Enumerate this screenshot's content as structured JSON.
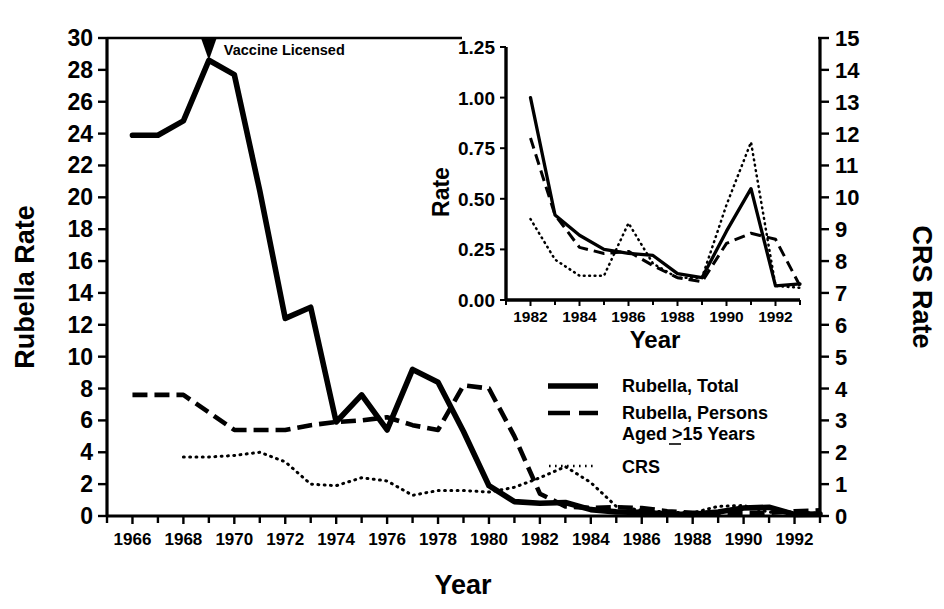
{
  "figure": {
    "annotation": "Vaccine Licensed",
    "xlabel": "Year",
    "left_axis_title": "Rubella Rate",
    "right_axis_title": "CRS Rate"
  },
  "legend": {
    "items": [
      {
        "label": "Rubella, Total",
        "style": "solid"
      },
      {
        "label": "Rubella, Persons",
        "label2": "Aged >15 Years",
        "style": "dashed"
      },
      {
        "label": "CRS",
        "style": "dotted"
      }
    ]
  },
  "inset": {
    "ylabel": "Rate",
    "xlabel": "Year"
  },
  "chart_data": [
    {
      "type": "line",
      "id": "main-chart",
      "title": "",
      "xlabel": "Year",
      "ylabel": "Rubella Rate",
      "y2label": "CRS Rate",
      "xlim": [
        1965,
        1993
      ],
      "ylim": [
        0,
        30
      ],
      "y2lim": [
        0,
        15
      ],
      "grid": false,
      "xticks": [
        1966,
        1968,
        1970,
        1972,
        1974,
        1976,
        1978,
        1980,
        1982,
        1984,
        1986,
        1988,
        1990,
        1992
      ],
      "xtick_labels": [
        "1966",
        "1968",
        "1970",
        "1972",
        "1974",
        "1976",
        "1978",
        "1980",
        "1982",
        "1984",
        "1986",
        "1988",
        "1990",
        "1992"
      ],
      "xtick_minor": [
        1965,
        1967,
        1969,
        1971,
        1973,
        1975,
        1977,
        1979,
        1981,
        1983,
        1985,
        1987,
        1989,
        1991,
        1993
      ],
      "yticks": [
        0,
        2,
        4,
        6,
        8,
        10,
        12,
        14,
        16,
        18,
        20,
        22,
        24,
        26,
        28,
        30
      ],
      "ytick_labels": [
        "0",
        "2",
        "4",
        "6",
        "8",
        "10",
        "12",
        "14",
        "16",
        "18",
        "20",
        "22",
        "24",
        "26",
        "28",
        "30"
      ],
      "y2ticks": [
        0,
        1,
        2,
        3,
        4,
        5,
        6,
        7,
        8,
        9,
        10,
        11,
        12,
        13,
        14,
        15
      ],
      "y2tick_labels": [
        "0",
        "1",
        "2",
        "3",
        "4",
        "5",
        "6",
        "7",
        "8",
        "9",
        "10",
        "11",
        "12",
        "13",
        "14",
        "15"
      ],
      "annotations": [
        {
          "text": "Vaccine Licensed",
          "x": 1969,
          "y": 30,
          "marker": "down-arrow"
        }
      ],
      "x": [
        1966,
        1967,
        1968,
        1969,
        1970,
        1971,
        1972,
        1973,
        1974,
        1975,
        1976,
        1977,
        1978,
        1979,
        1980,
        1981,
        1982,
        1983,
        1984,
        1985,
        1986,
        1987,
        1988,
        1989,
        1990,
        1991,
        1992,
        1993
      ],
      "series": [
        {
          "name": "Rubella, Total",
          "axis": "left",
          "style": "solid",
          "values": [
            23.9,
            23.9,
            24.8,
            28.6,
            27.7,
            20.4,
            12.4,
            13.1,
            5.9,
            7.6,
            5.4,
            9.2,
            8.4,
            5.3,
            1.9,
            0.9,
            0.8,
            0.85,
            0.4,
            0.26,
            0.23,
            0.12,
            0.1,
            0.25,
            0.5,
            0.55,
            0.1,
            0.12
          ]
        },
        {
          "name": "Rubella, Persons Aged >15 Years",
          "axis": "left",
          "style": "dashed",
          "values": [
            7.6,
            7.6,
            7.6,
            6.5,
            5.4,
            5.4,
            5.4,
            5.7,
            5.9,
            6.0,
            6.2,
            5.7,
            5.4,
            8.2,
            8.0,
            5.0,
            1.4,
            0.6,
            0.5,
            0.55,
            0.5,
            0.3,
            0.2,
            0.2,
            0.2,
            0.2,
            0.3,
            0.35
          ]
        },
        {
          "name": "CRS",
          "axis": "right",
          "style": "dotted",
          "values": [
            null,
            null,
            1.85,
            1.85,
            1.9,
            2.0,
            1.7,
            1.0,
            0.95,
            1.2,
            1.1,
            0.65,
            0.8,
            0.8,
            0.75,
            0.9,
            1.2,
            1.55,
            1.05,
            0.3,
            0.18,
            0.12,
            0.1,
            0.3,
            0.33,
            0.12,
            0.13,
            0.08
          ]
        }
      ]
    },
    {
      "type": "line",
      "id": "inset-chart",
      "title": "",
      "xlabel": "Year",
      "ylabel": "Rate",
      "xlim": [
        1981,
        1993
      ],
      "ylim": [
        0,
        1.25
      ],
      "grid": false,
      "xticks": [
        1982,
        1984,
        1986,
        1988,
        1990,
        1992
      ],
      "xtick_labels": [
        "1982",
        "1984",
        "1986",
        "1988",
        "1990",
        "1992"
      ],
      "xtick_minor": [
        1981,
        1983,
        1985,
        1987,
        1989,
        1991,
        1993
      ],
      "yticks": [
        0.0,
        0.25,
        0.5,
        0.75,
        1.0,
        1.25
      ],
      "ytick_labels": [
        "0.00",
        "0.25",
        "0.50",
        "0.75",
        "1.00",
        "1.25"
      ],
      "x": [
        1982,
        1983,
        1984,
        1985,
        1986,
        1987,
        1988,
        1989,
        1990,
        1991,
        1992,
        1993
      ],
      "series": [
        {
          "name": "Rubella, Total",
          "style": "solid",
          "values": [
            1.0,
            0.42,
            0.32,
            0.25,
            0.23,
            0.22,
            0.13,
            0.11,
            0.34,
            0.55,
            0.07,
            0.08
          ]
        },
        {
          "name": "Rubella, Persons Aged >15 Years",
          "style": "dashed",
          "values": [
            0.8,
            0.42,
            0.26,
            0.23,
            0.24,
            0.17,
            0.11,
            0.09,
            0.28,
            0.33,
            0.3,
            0.07
          ]
        },
        {
          "name": "CRS",
          "style": "dotted",
          "values": [
            0.4,
            0.2,
            0.12,
            0.12,
            0.38,
            0.18,
            0.11,
            0.11,
            0.47,
            0.78,
            0.07,
            0.06
          ]
        }
      ]
    }
  ]
}
